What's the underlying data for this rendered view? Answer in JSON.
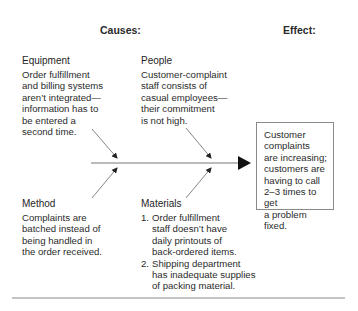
{
  "headers": {
    "causes": "Causes:",
    "effect": "Effect:"
  },
  "categories": {
    "equipment": {
      "title": "Equipment",
      "lines": [
        "Order fulfillment",
        "and billing systems",
        "aren’t integrated—",
        "information has to",
        "be entered a",
        "second time."
      ]
    },
    "people": {
      "title": "People",
      "lines": [
        "Customer-complaint",
        "staff consists of",
        "casual employees—",
        "their commitment",
        "is not high."
      ]
    },
    "method": {
      "title": "Method",
      "lines": [
        "Complaints are",
        "batched instead of",
        "being handled in",
        "the order received."
      ]
    },
    "materials": {
      "title": "Materials",
      "items": [
        {
          "num": "1.",
          "lines": [
            "Order fulfillment",
            "staff doesn’t have",
            "daily printouts of",
            "back-ordered items."
          ]
        },
        {
          "num": "2.",
          "lines": [
            "Shipping department",
            "has inadequate supplies",
            "of packing material."
          ]
        }
      ]
    }
  },
  "effect": {
    "lines": [
      "Customer",
      "complaints",
      "are increasing;",
      "customers are",
      "having to call",
      "2–3 times to get",
      "a problem fixed."
    ]
  },
  "colors": {
    "line": "#777777",
    "arrowhead": "#111111",
    "box_border": "#8a8a8a"
  }
}
